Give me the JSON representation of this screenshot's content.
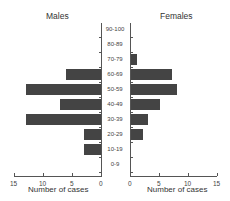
{
  "chart_data": {
    "type": "bar",
    "subtype": "population-pyramid",
    "categories": [
      "0-9",
      "10-19",
      "20-29",
      "30-39",
      "40-49",
      "50-59",
      "60-69",
      "70-79",
      "80-89",
      "90-100"
    ],
    "series": [
      {
        "name": "Males",
        "values": [
          0,
          3,
          3,
          13,
          7,
          13,
          6,
          0,
          0,
          0
        ]
      },
      {
        "name": "Females",
        "values": [
          0,
          0,
          2,
          3,
          5,
          8,
          7,
          1,
          0,
          0
        ]
      }
    ],
    "xlabel": "Number of cases",
    "xlim": [
      0,
      15
    ],
    "xticks": [
      "15",
      "10",
      "5",
      "0"
    ],
    "xticks_right": [
      "0",
      "5",
      "10",
      "15"
    ],
    "grid": false,
    "color": "#444444"
  },
  "titles": {
    "left": "Males",
    "right": "Females"
  },
  "xlabel": "Number of cases"
}
